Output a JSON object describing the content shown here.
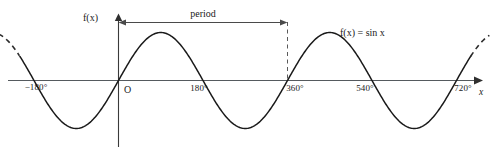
{
  "figure": {
    "title_label": "f(x)",
    "period_label": "period",
    "equation_label": "f(x) = sin x",
    "origin_label": "O",
    "x_axis_label": "x",
    "tick_labels": [
      "−180°",
      "180°",
      "360°",
      "540°",
      "720°"
    ],
    "colors": {
      "curve": "#1a1a1a",
      "axis": "#555a5e",
      "dashed": "#5a5a5a",
      "background": "#ffffff"
    }
  },
  "chart_data": {
    "type": "line",
    "title": "",
    "xlabel": "x",
    "ylabel": "f(x)",
    "function": "f(x) = sin x",
    "x_unit": "degrees",
    "xlim": [
      -250,
      790
    ],
    "ylim": [
      -1.35,
      1.35
    ],
    "grid": false,
    "legend": "none",
    "xticks": [
      -180,
      0,
      180,
      360,
      540,
      720
    ],
    "xtick_labels": [
      "−180°",
      "O",
      "180°",
      "360°",
      "540°",
      "720°"
    ],
    "yticks": [],
    "annotations": [
      {
        "text": "period",
        "x_start": 0,
        "x_end": 360,
        "kind": "double-arrow",
        "y": 1.22
      },
      {
        "text": "f(x) = sin x",
        "x": 520,
        "y": 1.08,
        "kind": "curve-label"
      }
    ],
    "series": [
      {
        "name": "sin x",
        "x_domain_solid": [
          -210,
          750
        ],
        "x_domain_dashed_left": [
          -255,
          -210
        ],
        "x_domain_dashed_right": [
          750,
          790
        ],
        "amplitude": 1,
        "period": 360,
        "phase": 0,
        "key_points": [
          {
            "x": -180,
            "y": 0
          },
          {
            "x": -90,
            "y": -1
          },
          {
            "x": 0,
            "y": 0
          },
          {
            "x": 90,
            "y": 1
          },
          {
            "x": 180,
            "y": 0
          },
          {
            "x": 270,
            "y": -1
          },
          {
            "x": 360,
            "y": 0
          },
          {
            "x": 450,
            "y": 1
          },
          {
            "x": 540,
            "y": 0
          },
          {
            "x": 630,
            "y": -1
          },
          {
            "x": 720,
            "y": 0
          }
        ]
      }
    ]
  }
}
